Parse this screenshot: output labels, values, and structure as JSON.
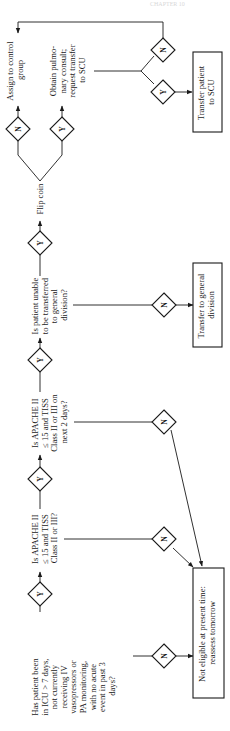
{
  "header": {
    "faint_text": "CHAPTER 10"
  },
  "decisions": {
    "q1": {
      "lines": [
        "Has patient been",
        "in ICU > 7 days,",
        "not currently",
        "receiving IV",
        "vasopressors or",
        "PA monitoring,",
        "with no acute",
        "event in past 3",
        "days?"
      ]
    },
    "q2": {
      "lines": [
        "Is APACHE II",
        "≤ 15 and TISS",
        "Class II or III?"
      ]
    },
    "q3": {
      "lines": [
        "Is APACHE II",
        "≤ 15 and TISS",
        "Class II or III on",
        "next 2 days?"
      ]
    },
    "q4": {
      "lines": [
        "Is patient unable",
        "to be transferred",
        "to general",
        "division?"
      ]
    }
  },
  "answers": {
    "yes": "Y",
    "no": "N"
  },
  "actions": {
    "flip_coin": "Flip coin",
    "assign_control": {
      "lines": [
        "Assign to control",
        "group"
      ]
    },
    "obtain_consult": {
      "lines": [
        "Obtain pulmo-",
        "nary consult;",
        "request transfer",
        "to SCU"
      ]
    }
  },
  "outcomes": {
    "transfer_scu": {
      "lines": [
        "Transfer patient",
        "to SCU"
      ]
    },
    "transfer_general": {
      "lines": [
        "Transfer to general",
        "division"
      ]
    },
    "not_eligible": {
      "lines": [
        "Not eligible at present time:",
        "reassess tomorrow"
      ]
    }
  },
  "colors": {
    "ink": "#1a1a1a",
    "background": "#ffffff"
  }
}
